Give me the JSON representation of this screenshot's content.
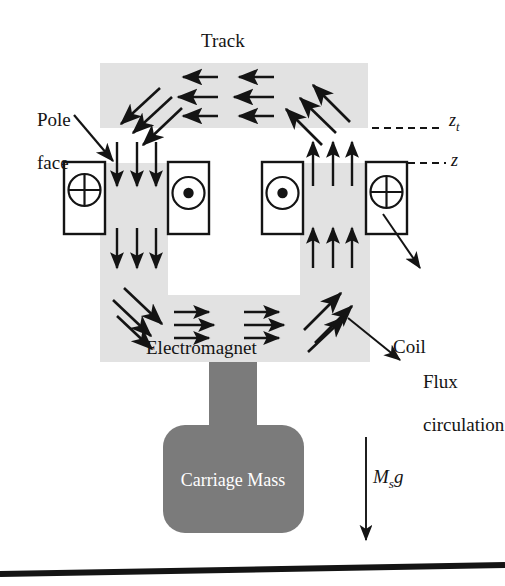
{
  "figure": {
    "type": "technical-diagram",
    "background_color": "#ffffff",
    "track_fill": "#e2e2e2",
    "electromagnet_fill": "#e2e2e2",
    "carriage_fill": "#7b7b7b",
    "stroke_color": "#141414"
  },
  "labels": {
    "track": "Track",
    "pole_face": "Pole\nface",
    "coil": "Coil",
    "flux_circulation": "Flux\ncirculation",
    "electromagnet": "Electromagnet",
    "carriage_mass": "Carriage Mass",
    "z_track": "z",
    "z_track_sub": "t",
    "z_gap": "z",
    "weight_M": "M",
    "weight_sub": "s",
    "weight_g": "g"
  },
  "coils": [
    {
      "name": "coil-outer-left",
      "symbol": "circle-cross",
      "meaning": "current into page"
    },
    {
      "name": "coil-inner-left",
      "symbol": "circle-dot",
      "meaning": "current out of page"
    },
    {
      "name": "coil-inner-right",
      "symbol": "circle-dot",
      "meaning": "current out of page"
    },
    {
      "name": "coil-outer-right",
      "symbol": "circle-cross",
      "meaning": "current into page"
    }
  ],
  "flux": {
    "track_horizontal_left_group": 3,
    "track_horizontal_right_group": 3,
    "track_direction": "left",
    "left_limb_down_arrows": 6,
    "right_limb_up_arrows": 6,
    "base_right_arrows": 6,
    "corner_diagonals": 4
  },
  "annotations": {
    "pole_face_leader": "arrow from label to left pole face",
    "coil_leader": "arrow from outer-right coil box to Coil label",
    "flux_leader": "arrow from electromagnet base to Flux circulation label",
    "gravity_arrow": "downward arrow labelled M_s g"
  },
  "ground": {
    "name": "ground-line",
    "color": "#141414"
  }
}
